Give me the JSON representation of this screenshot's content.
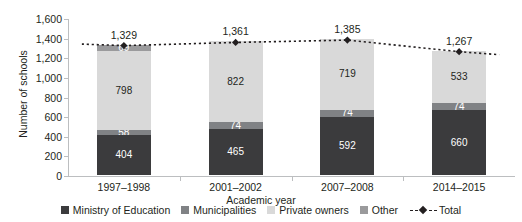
{
  "chart_data": {
    "type": "bar",
    "subtype": "stacked-bar-with-line-overlay",
    "title": "",
    "xlabel": "Academic year",
    "ylabel": "Number of schools",
    "categories": [
      "1997–1998",
      "2001–2002",
      "2007–2008",
      "2014–2015"
    ],
    "ylim": [
      0,
      1600
    ],
    "yticks": [
      0,
      200,
      400,
      600,
      800,
      1000,
      1200,
      1400,
      1600
    ],
    "ytick_labels": [
      "0",
      "200",
      "400",
      "600",
      "800",
      "1,000",
      "1,200",
      "1,400",
      "1,600"
    ],
    "grid": false,
    "legend_position": "bottom",
    "series": [
      {
        "name": "Ministry of Education",
        "color": "#3b3b3d",
        "values": [
          404,
          465,
          592,
          660
        ],
        "labels": [
          "404",
          "465",
          "592",
          "660"
        ],
        "label_color": "#ffffff"
      },
      {
        "name": "Municipalities",
        "color": "#808285",
        "values": [
          58,
          74,
          74,
          74
        ],
        "labels": [
          "58",
          "74",
          "74",
          "74"
        ],
        "label_color": "#ffffff"
      },
      {
        "name": "Private owners",
        "color": "#d9d9d9",
        "values": [
          798,
          822,
          719,
          533
        ],
        "labels": [
          "798",
          "822",
          "719",
          "533"
        ],
        "label_color": "#231f20"
      },
      {
        "name": "Other",
        "color": "#9a9a9c",
        "values": [
          69,
          0,
          0,
          0
        ],
        "labels": [
          "69",
          "",
          "",
          ""
        ],
        "label_color": "#ffffff"
      }
    ],
    "total_line": {
      "name": "Total",
      "color": "#231f20",
      "style": "dotted",
      "marker": "diamond",
      "values": [
        1329,
        1361,
        1385,
        1267
      ],
      "labels": [
        "1,329",
        "1,361",
        "1,385",
        "1,267"
      ]
    }
  },
  "legend": {
    "items": [
      {
        "label": "Ministry of Education",
        "color": "#3b3b3d",
        "kind": "swatch"
      },
      {
        "label": "Municipalities",
        "color": "#808285",
        "kind": "swatch"
      },
      {
        "label": "Private owners",
        "color": "#d9d9d9",
        "kind": "swatch"
      },
      {
        "label": "Other",
        "color": "#9a9a9c",
        "kind": "swatch"
      },
      {
        "label": "Total",
        "color": "#231f20",
        "kind": "line"
      }
    ]
  }
}
